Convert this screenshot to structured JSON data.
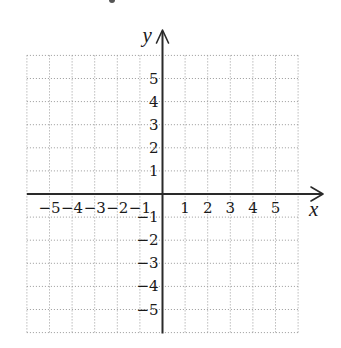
{
  "chart_data": {
    "type": "coordinate-plane",
    "title": "",
    "xlabel": "x",
    "ylabel": "y",
    "xlim": [
      -6,
      6
    ],
    "ylim": [
      -6,
      6
    ],
    "grid": true,
    "grid_style": "dotted",
    "x_ticks": [
      -5,
      -4,
      -3,
      -2,
      -1,
      1,
      2,
      3,
      4,
      5
    ],
    "y_ticks": [
      5,
      4,
      3,
      2,
      1,
      -1,
      -2,
      -3,
      -4,
      -5
    ],
    "x_tick_labels": [
      "−5",
      "−4",
      "−3",
      "−2",
      "−1",
      "1",
      "2",
      "3",
      "4",
      "5"
    ],
    "y_tick_labels": [
      "5",
      "4",
      "3",
      "2",
      "1",
      "−1",
      "−2",
      "−3",
      "−4",
      "−5"
    ],
    "series": [],
    "legend": null
  },
  "layout": {
    "origin_px": [
      162.5,
      194
    ],
    "unit_x_px": 22.6,
    "unit_y_px": 23.1,
    "x_arrow_tip_px": 323,
    "y_arrow_tip_px": 30
  },
  "colors": {
    "grid": "#9a9a9a",
    "axis": "#2a2a2a",
    "text": "#1a1a1a",
    "background": "#ffffff"
  }
}
